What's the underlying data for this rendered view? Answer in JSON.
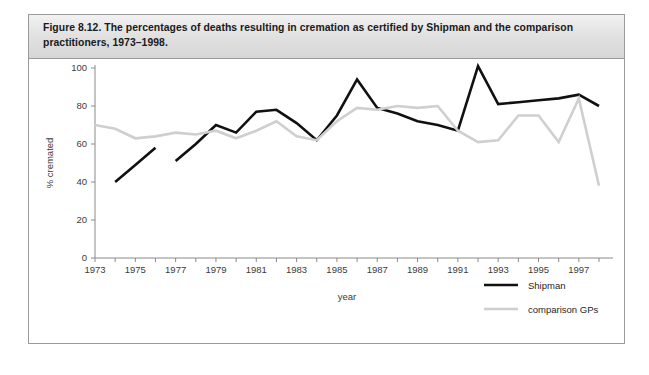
{
  "figure": {
    "caption": "Figure 8.12. The percentages of deaths resulting in cremation as certified by Shipman and the comparison practitioners, 1973–1998."
  },
  "colors": {
    "shipman": "#111111",
    "comparison_gps": "#cfcfcf",
    "axis": "#8a8a8a",
    "caption_band": "#e2e2e2",
    "border": "#9a9a9a"
  },
  "chart_data": {
    "type": "line",
    "title": "Figure 8.12. The percentages of deaths resulting in cremation as certified by Shipman and the comparison practitioners, 1973–1998.",
    "xlabel": "year",
    "ylabel": "% cremated",
    "xlim": [
      1973,
      1998
    ],
    "ylim": [
      0,
      100
    ],
    "yticks": [
      0,
      20,
      40,
      60,
      80,
      100
    ],
    "ytick_labels": [
      "0",
      "20",
      "40",
      "60",
      "80",
      "100"
    ],
    "xticks": [
      1973,
      1974,
      1975,
      1976,
      1977,
      1978,
      1979,
      1980,
      1981,
      1982,
      1983,
      1984,
      1985,
      1986,
      1987,
      1988,
      1989,
      1990,
      1991,
      1992,
      1993,
      1994,
      1995,
      1996,
      1997,
      1998
    ],
    "xtick_labels": [
      "1973",
      "",
      "1975",
      "",
      "1977",
      "",
      "1979",
      "",
      "1981",
      "",
      "1983",
      "",
      "1985",
      "",
      "1987",
      "",
      "1989",
      "",
      "1991",
      "",
      "1993",
      "",
      "1995",
      "",
      "1997",
      ""
    ],
    "grid": false,
    "legend_position": "lower right",
    "series": [
      {
        "name": "Shipman",
        "color": "#111111",
        "x": [
          1974,
          1975,
          1976,
          1977,
          1978,
          1979,
          1980,
          1981,
          1982,
          1983,
          1984,
          1985,
          1986,
          1987,
          1988,
          1989,
          1990,
          1991,
          1992,
          1993,
          1994,
          1995,
          1996,
          1997,
          1998
        ],
        "values": [
          40,
          49,
          58,
          51,
          60,
          70,
          66,
          77,
          78,
          71,
          62,
          75,
          94,
          79,
          76,
          72,
          70,
          67,
          101,
          81,
          82,
          83,
          84,
          86,
          80
        ],
        "gaps": [
          [
            1976,
            1977
          ]
        ]
      },
      {
        "name": "comparison GPs",
        "color": "#cfcfcf",
        "x": [
          1973,
          1974,
          1975,
          1976,
          1977,
          1978,
          1979,
          1980,
          1981,
          1982,
          1983,
          1984,
          1985,
          1986,
          1987,
          1988,
          1989,
          1990,
          1991,
          1992,
          1993,
          1994,
          1995,
          1996,
          1997,
          1998
        ],
        "values": [
          70,
          68,
          63,
          64,
          66,
          65,
          67,
          63,
          67,
          72,
          64,
          62,
          72,
          79,
          78,
          80,
          79,
          80,
          67,
          61,
          62,
          75,
          75,
          61,
          84,
          38
        ]
      }
    ]
  },
  "legend": {
    "items": [
      {
        "label": "Shipman",
        "color": "#111111"
      },
      {
        "label": "comparison GPs",
        "color": "#cfcfcf"
      }
    ]
  }
}
